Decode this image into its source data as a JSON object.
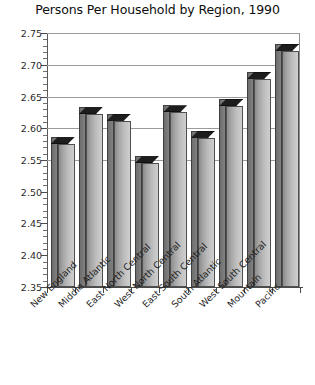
{
  "chart_data": {
    "type": "bar",
    "title": "Persons Per Household by Region, 1990",
    "xlabel": "",
    "ylabel": "",
    "ylim": [
      2.35,
      2.75
    ],
    "ytick_step": 0.05,
    "grid": true,
    "legend": "none",
    "three_d": true,
    "categories": [
      "New England",
      "Middle Atlantic",
      "East North Central",
      "West North Central",
      "East South Central",
      "South Atlantic",
      "West South Central",
      "Mountain",
      "Pacific"
    ],
    "values": [
      2.575,
      2.622,
      2.612,
      2.545,
      2.625,
      2.585,
      2.635,
      2.678,
      2.722
    ],
    "ytick_labels": [
      "2.75",
      "2.70",
      "2.65",
      "2.60",
      "2.55",
      "2.50",
      "2.45",
      "2.40",
      "2.35"
    ],
    "ytick_values": [
      2.75,
      2.7,
      2.65,
      2.6,
      2.55,
      2.5,
      2.45,
      2.4,
      2.35
    ],
    "gridline_values": [
      2.75,
      2.7,
      2.65,
      2.6,
      2.55
    ],
    "colors": {
      "bar_front": "#bdbdbd",
      "bar_side": "#757575",
      "bar_top": "#1d1d1d",
      "gridline": "#9b9b9b",
      "axis": "#4a4a4a",
      "background": "#ffffff",
      "text": "#111111"
    }
  }
}
